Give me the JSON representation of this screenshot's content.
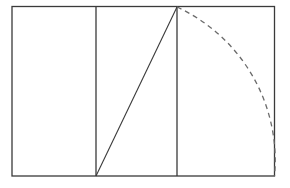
{
  "figure": {
    "type": "geometric-construction",
    "canvas": {
      "width": 290,
      "height": 188
    },
    "background_color": "#ffffff",
    "stroke_color": "#3a3a3a",
    "stroke_color_light": "#6b6b6b",
    "stroke_width": 1.2
  },
  "geometry": {
    "outer_rectangle": {
      "label": "outer-rectangle",
      "x1": 12,
      "y1": 6.5,
      "x2": 274.5,
      "y2": 176,
      "width": 262.5,
      "height": 169.5
    },
    "vertical_divider_left": {
      "label": "vertical-divider-left",
      "x": 96,
      "y1": 6.5,
      "y2": 176
    },
    "vertical_divider_right": {
      "label": "vertical-divider-right",
      "x": 177,
      "y1": 6.5,
      "y2": 176
    },
    "diagonal": {
      "label": "diagonal-line",
      "x1": 96,
      "y1": 176,
      "x2": 177,
      "y2": 7
    },
    "arc": {
      "label": "dashed-arc",
      "start_x": 177,
      "start_y": 7,
      "end_x": 274.5,
      "end_y": 176,
      "center_x": 177,
      "center_y": 176,
      "radius": 169,
      "sweep": "clockwise",
      "style": "dashed",
      "dash_pattern": "5 4"
    }
  },
  "panels": [
    {
      "name": "panel-left",
      "x": 12,
      "width": 84
    },
    {
      "name": "panel-middle",
      "x": 96,
      "width": 81
    },
    {
      "name": "panel-right",
      "x": 177,
      "width": 97.5
    }
  ]
}
